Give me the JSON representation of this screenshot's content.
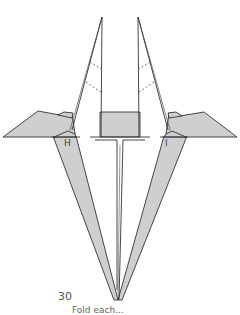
{
  "figure": {
    "step_number": "30",
    "caption": "Fold each...",
    "labels": {
      "left_point": "H",
      "right_point": "I"
    },
    "colors": {
      "fill": "#cfcfcf",
      "stroke": "#333333",
      "background": "#ffffff"
    }
  }
}
